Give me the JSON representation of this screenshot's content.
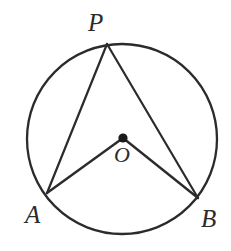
{
  "figure": {
    "kind": "circle-geometry-diagram",
    "canvas": {
      "width": 231,
      "height": 251,
      "background": "#ffffff"
    },
    "style": {
      "stroke_color": "#2b2b2b",
      "circle_stroke_width": 2.3,
      "chord_stroke_width": 2.2,
      "radius_stroke_width": 2.4,
      "center_dot_color": "#1a1a1a",
      "center_dot_radius": 4.6,
      "label_color": "#2b2b2b"
    },
    "circle": {
      "cx": 122,
      "cy": 139,
      "r": 95
    },
    "points": [
      {
        "id": "P",
        "label": "P",
        "x": 107,
        "y": 44,
        "on_circle": true,
        "label_dx": -19,
        "label_dy": -34
      },
      {
        "id": "A",
        "label": "A",
        "x": 47,
        "y": 193,
        "on_circle": true,
        "label_dx": -22,
        "label_dy": 9
      },
      {
        "id": "B",
        "label": "B",
        "x": 198,
        "y": 198,
        "on_circle": true,
        "label_dx": 3,
        "label_dy": 8
      },
      {
        "id": "O",
        "label": "O",
        "x": 123,
        "y": 138,
        "on_circle": false,
        "label_dx": -9,
        "label_dy": 6
      }
    ],
    "segments": [
      {
        "id": "PA",
        "from": "P",
        "to": "A",
        "role": "chord"
      },
      {
        "id": "PB",
        "from": "P",
        "to": "B",
        "role": "chord"
      },
      {
        "id": "OA",
        "from": "O",
        "to": "A",
        "role": "radius"
      },
      {
        "id": "OB",
        "from": "O",
        "to": "B",
        "role": "radius"
      }
    ],
    "angles": [
      {
        "id": "APB",
        "vertex": "P",
        "rays": [
          "A",
          "B"
        ],
        "type": "inscribed"
      },
      {
        "id": "AOB",
        "vertex": "O",
        "rays": [
          "A",
          "B"
        ],
        "type": "central"
      }
    ]
  },
  "labels": {
    "P": "P",
    "A": "A",
    "B": "B",
    "O": "O"
  }
}
